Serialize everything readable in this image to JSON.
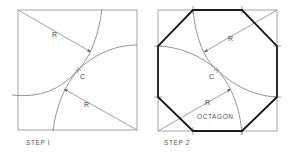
{
  "figure": {
    "step1": {
      "caption": "STEP I",
      "radius_label_1": "R",
      "radius_label_2": "R",
      "center_label": "C"
    },
    "step2": {
      "caption": "STEP 2",
      "radius_label_1": "R",
      "radius_label_2": "R",
      "center_label": "C",
      "shape_label": "OCTAGON"
    },
    "colors": {
      "construction_line": "#8a8a8a",
      "octagon_outline": "#1a1a1a",
      "background": "#ffffff"
    }
  }
}
